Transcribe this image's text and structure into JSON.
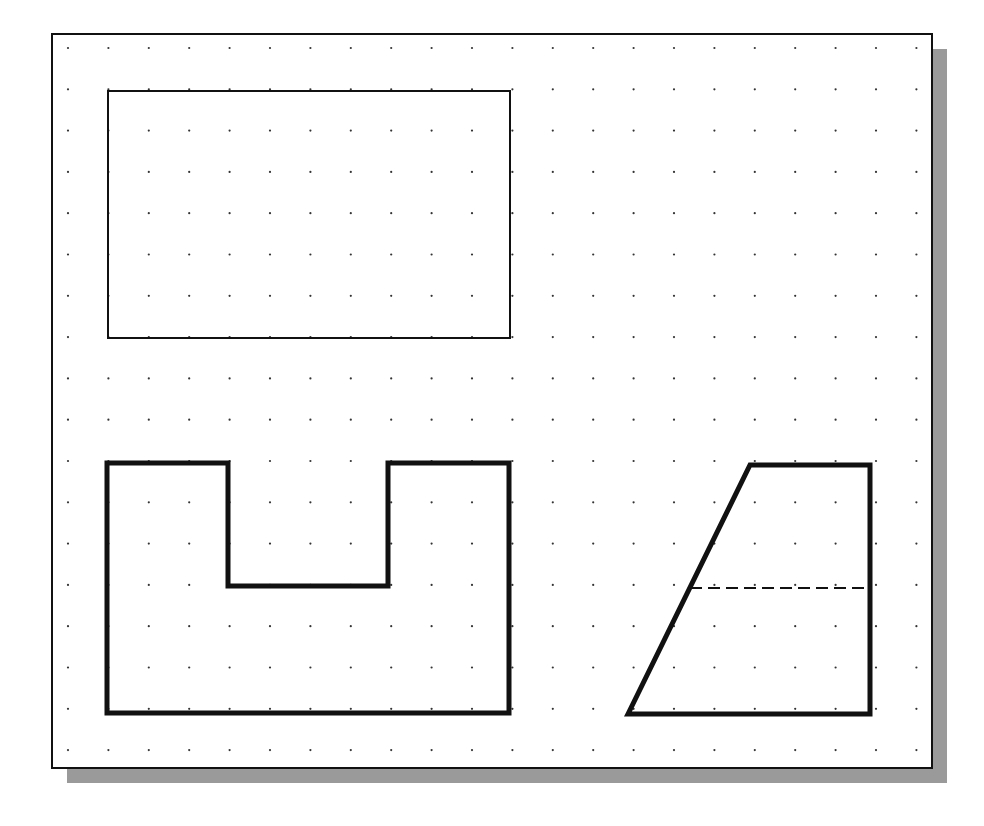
{
  "drawing_area": {
    "frame": {
      "x": 52,
      "y": 34,
      "width": 880,
      "height": 734,
      "stroke": "#111111",
      "stroke_width": 2
    },
    "shadow": {
      "offset": 15,
      "color": "#9a9a9a"
    },
    "grid": {
      "origin_x": 68,
      "origin_y": 48,
      "spacing_x": 40.4,
      "spacing_y": 41.3,
      "cols": 22,
      "rows": 18,
      "dot_radius": 1.1,
      "dot_color": "#333333"
    }
  },
  "shapes": [
    {
      "name": "thin-rectangle",
      "type": "polygon",
      "points": [
        [
          108,
          91
        ],
        [
          510,
          91
        ],
        [
          510,
          338
        ],
        [
          108,
          338
        ]
      ],
      "stroke_width": 2,
      "dashed": false
    },
    {
      "name": "u-shape-profile",
      "type": "polygon",
      "points": [
        [
          107,
          463
        ],
        [
          228,
          463
        ],
        [
          228,
          586
        ],
        [
          388,
          586
        ],
        [
          388,
          463
        ],
        [
          509,
          463
        ],
        [
          509,
          713
        ],
        [
          107,
          713
        ]
      ],
      "stroke_width": 5,
      "dashed": false
    },
    {
      "name": "trapezoid-profile",
      "type": "polygon",
      "points": [
        [
          628,
          714
        ],
        [
          750,
          465
        ],
        [
          870,
          465
        ],
        [
          870,
          714
        ]
      ],
      "stroke_width": 5,
      "dashed": false
    },
    {
      "name": "hidden-line",
      "type": "line",
      "points": [
        [
          690,
          588
        ],
        [
          868,
          588
        ]
      ],
      "stroke_width": 2,
      "dashed": true,
      "dash": "12 6"
    }
  ],
  "colors": {
    "line": "#111111",
    "background": "#ffffff"
  }
}
